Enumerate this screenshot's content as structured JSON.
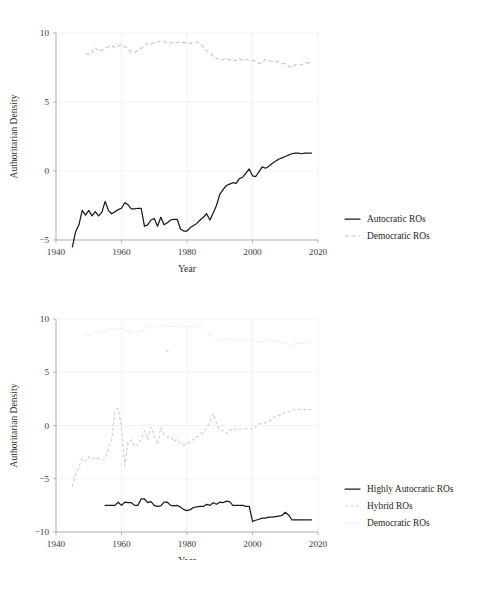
{
  "figure": {
    "axis_label_y": "Authoritarian Density",
    "axis_label_x": "Year",
    "caption_fragment": ""
  },
  "chart_data": [
    {
      "id": "top",
      "type": "line",
      "title": "",
      "xlabel": "Year",
      "ylabel": "Authoritarian Density",
      "xlim": [
        1940,
        2020
      ],
      "ylim": [
        -5,
        10
      ],
      "xticks": [
        1940,
        1960,
        1980,
        2000,
        2020
      ],
      "yticks": [
        -5,
        0,
        5,
        10
      ],
      "grid": true,
      "legend_position": "right",
      "series": [
        {
          "name": "Autocratic ROs",
          "style": "solid",
          "color": "#1a1a1a",
          "x": [
            1945,
            1946,
            1947,
            1948,
            1949,
            1950,
            1951,
            1952,
            1953,
            1954,
            1955,
            1956,
            1957,
            1958,
            1959,
            1960,
            1961,
            1962,
            1963,
            1964,
            1965,
            1966,
            1967,
            1968,
            1969,
            1970,
            1971,
            1972,
            1973,
            1974,
            1975,
            1976,
            1977,
            1978,
            1979,
            1980,
            1981,
            1982,
            1983,
            1984,
            1985,
            1986,
            1987,
            1988,
            1989,
            1990,
            1991,
            1992,
            1993,
            1994,
            1995,
            1996,
            1997,
            1998,
            1999,
            2000,
            2001,
            2002,
            2003,
            2004,
            2005,
            2006,
            2007,
            2008,
            2009,
            2010,
            2011,
            2012,
            2013,
            2014,
            2015,
            2016,
            2017,
            2018
          ],
          "values": [
            -5.5,
            -4.4,
            -3.9,
            -2.85,
            -3.2,
            -2.85,
            -3.25,
            -2.95,
            -3.25,
            -3.0,
            -2.2,
            -2.85,
            -3.1,
            -2.95,
            -2.8,
            -2.7,
            -2.3,
            -2.45,
            -2.75,
            -2.75,
            -2.7,
            -2.7,
            -4.0,
            -3.9,
            -3.55,
            -3.45,
            -4.0,
            -3.35,
            -3.9,
            -3.75,
            -3.55,
            -3.5,
            -3.5,
            -4.2,
            -4.35,
            -4.35,
            -4.1,
            -3.95,
            -3.8,
            -3.55,
            -3.35,
            -3.1,
            -3.55,
            -3.05,
            -2.5,
            -1.7,
            -1.35,
            -1.05,
            -0.95,
            -0.85,
            -0.9,
            -0.55,
            -0.45,
            -0.15,
            0.15,
            -0.35,
            -0.4,
            -0.05,
            0.3,
            0.2,
            0.35,
            0.55,
            0.7,
            0.85,
            0.95,
            1.05,
            1.15,
            1.25,
            1.3,
            1.3,
            1.25,
            1.3,
            1.3,
            1.3
          ]
        },
        {
          "name": "Democratic ROs",
          "style": "dashed",
          "color": "#c6c6c6",
          "x": [
            1949,
            1950,
            1951,
            1952,
            1953,
            1954,
            1955,
            1956,
            1957,
            1958,
            1959,
            1960,
            1961,
            1962,
            1963,
            1964,
            1965,
            1966,
            1967,
            1968,
            1969,
            1970,
            1971,
            1972,
            1973,
            1974,
            1975,
            1976,
            1977,
            1978,
            1979,
            1980,
            1981,
            1982,
            1983,
            1984,
            1985,
            1986,
            1987,
            1988,
            1989,
            1990,
            1991,
            1992,
            1993,
            1994,
            1995,
            1996,
            1997,
            1998,
            1999,
            2000,
            2001,
            2002,
            2003,
            2004,
            2005,
            2006,
            2007,
            2008,
            2009,
            2010,
            2011,
            2012,
            2013,
            2014,
            2015,
            2016,
            2017,
            2018
          ],
          "values": [
            8.5,
            8.45,
            8.6,
            8.95,
            8.65,
            8.75,
            8.9,
            9.0,
            9.1,
            8.95,
            9.05,
            9.15,
            9.0,
            8.85,
            8.6,
            8.6,
            8.75,
            8.9,
            9.05,
            9.3,
            9.2,
            9.3,
            9.35,
            9.45,
            9.4,
            9.25,
            9.3,
            9.3,
            9.3,
            9.35,
            9.3,
            9.3,
            9.25,
            9.3,
            9.35,
            9.2,
            9.0,
            8.7,
            8.6,
            8.3,
            8.15,
            8.1,
            8.05,
            8.2,
            8.05,
            8.05,
            8.0,
            8.15,
            8.0,
            8.1,
            8.0,
            8.0,
            7.95,
            7.8,
            7.85,
            8.1,
            8.0,
            7.95,
            7.95,
            7.9,
            7.8,
            7.75,
            7.6,
            7.5,
            7.7,
            7.7,
            7.7,
            7.8,
            7.85,
            7.8
          ]
        }
      ]
    },
    {
      "id": "bottom",
      "type": "line",
      "title": "",
      "xlabel": "Year",
      "ylabel": "Authoritarian Density",
      "xlim": [
        1940,
        2020
      ],
      "ylim": [
        -10,
        10
      ],
      "xticks": [
        1940,
        1960,
        1980,
        2000,
        2020
      ],
      "yticks": [
        -10,
        -5,
        0,
        5,
        10
      ],
      "grid": true,
      "legend_position": "right",
      "series": [
        {
          "name": "Highly Autocratic ROs",
          "style": "solid",
          "color": "#1a1a1a",
          "x": [
            1955,
            1956,
            1957,
            1958,
            1959,
            1960,
            1961,
            1962,
            1963,
            1964,
            1965,
            1966,
            1967,
            1968,
            1969,
            1970,
            1971,
            1972,
            1973,
            1974,
            1975,
            1976,
            1977,
            1978,
            1979,
            1980,
            1981,
            1982,
            1983,
            1984,
            1985,
            1986,
            1987,
            1988,
            1989,
            1990,
            1991,
            1992,
            1993,
            1994,
            1995,
            1996,
            1997,
            1998,
            1999,
            2000,
            2001,
            2002,
            2003,
            2004,
            2005,
            2006,
            2007,
            2008,
            2009,
            2010,
            2011,
            2012,
            2013,
            2014,
            2015,
            2016,
            2017,
            2018
          ],
          "values": [
            -7.5,
            -7.5,
            -7.5,
            -7.5,
            -7.2,
            -7.5,
            -7.2,
            -7.25,
            -7.25,
            -7.5,
            -7.5,
            -6.9,
            -6.9,
            -7.25,
            -7.15,
            -7.5,
            -7.6,
            -7.55,
            -7.2,
            -7.2,
            -7.5,
            -7.55,
            -7.5,
            -7.65,
            -7.9,
            -8.0,
            -7.9,
            -7.7,
            -7.65,
            -7.6,
            -7.6,
            -7.4,
            -7.5,
            -7.25,
            -7.4,
            -7.2,
            -7.25,
            -7.1,
            -7.15,
            -7.5,
            -7.5,
            -7.5,
            -7.5,
            -7.6,
            -7.6,
            -9.0,
            -8.9,
            -8.8,
            -8.7,
            -8.7,
            -8.6,
            -8.6,
            -8.55,
            -8.5,
            -8.45,
            -8.15,
            -8.4,
            -8.85,
            -8.85,
            -8.85,
            -8.85,
            -8.85,
            -8.85,
            -8.85
          ]
        },
        {
          "name": "Hybrid ROs",
          "style": "dashed",
          "color": "#cfcfcf",
          "x": [
            1945,
            1946,
            1947,
            1948,
            1949,
            1950,
            1951,
            1952,
            1953,
            1954,
            1955,
            1956,
            1957,
            1958,
            1959,
            1960,
            1961,
            1962,
            1963,
            1964,
            1965,
            1966,
            1967,
            1968,
            1969,
            1970,
            1971,
            1972,
            1973,
            1974,
            1975,
            1976,
            1977,
            1978,
            1979,
            1980,
            1981,
            1982,
            1983,
            1984,
            1985,
            1986,
            1987,
            1988,
            1989,
            1990,
            1991,
            1992,
            1993,
            1994,
            1995,
            1996,
            1997,
            1998,
            1999,
            2000,
            2001,
            2002,
            2003,
            2004,
            2005,
            2006,
            2007,
            2008,
            2009,
            2010,
            2011,
            2012,
            2013,
            2014,
            2015,
            2016,
            2017,
            2018
          ],
          "values": [
            -5.75,
            -4.6,
            -3.9,
            -3.1,
            -3.3,
            -2.95,
            -3.2,
            -3.0,
            -3.1,
            -3.2,
            -3.15,
            -2.15,
            -1.3,
            1.3,
            1.6,
            -0.2,
            -3.8,
            -1.55,
            -1.35,
            -2.0,
            -1.75,
            -1.3,
            -0.5,
            -1.3,
            -0.15,
            -1.0,
            -1.8,
            -0.2,
            -0.8,
            -1.1,
            -1.05,
            -1.5,
            -1.3,
            -1.7,
            -1.8,
            -1.75,
            -1.5,
            -1.3,
            -1.1,
            -0.85,
            -0.6,
            -0.3,
            0.4,
            1.1,
            0.2,
            -0.45,
            -0.5,
            -0.75,
            -0.4,
            -0.45,
            -0.3,
            -0.35,
            -0.3,
            -0.3,
            -0.25,
            -0.35,
            -0.1,
            0.15,
            0.15,
            0.25,
            0.4,
            0.65,
            0.85,
            0.95,
            1.05,
            1.3,
            1.25,
            1.45,
            1.5,
            1.5,
            1.5,
            1.5,
            1.5,
            1.5
          ]
        },
        {
          "name": "Democratic ROs",
          "style": "dotted",
          "color": "#e2e2e2",
          "x": [
            1949,
            1950,
            1951,
            1952,
            1953,
            1954,
            1955,
            1956,
            1957,
            1958,
            1959,
            1960,
            1961,
            1962,
            1963,
            1964,
            1965,
            1966,
            1967,
            1968,
            1969,
            1970,
            1971,
            1972,
            1973,
            1974,
            1975,
            1976,
            1977,
            1978,
            1979,
            1980,
            1981,
            1982,
            1983,
            1984,
            1985,
            1986,
            1987,
            1988,
            1989,
            1990,
            1991,
            1992,
            1993,
            1994,
            1995,
            1996,
            1997,
            1998,
            1999,
            2000,
            2001,
            2002,
            2003,
            2004,
            2005,
            2006,
            2007,
            2008,
            2009,
            2010,
            2011,
            2012,
            2013,
            2014,
            2015,
            2016,
            2017,
            2018
          ],
          "values": [
            8.5,
            8.45,
            8.6,
            8.95,
            8.65,
            8.75,
            8.9,
            9.0,
            9.1,
            8.95,
            9.05,
            9.15,
            9.0,
            8.85,
            8.6,
            8.6,
            8.75,
            8.9,
            9.05,
            9.3,
            9.2,
            9.3,
            9.35,
            9.45,
            9.4,
            9.25,
            9.3,
            9.3,
            9.3,
            9.35,
            9.3,
            9.3,
            9.25,
            9.3,
            9.35,
            9.2,
            9.0,
            8.7,
            8.6,
            8.3,
            8.15,
            8.1,
            8.05,
            8.2,
            8.05,
            8.05,
            8.0,
            8.15,
            8.0,
            8.1,
            8.0,
            8.0,
            7.95,
            7.8,
            7.85,
            8.1,
            8.0,
            7.95,
            7.95,
            7.9,
            7.8,
            7.75,
            7.6,
            7.5,
            7.7,
            7.7,
            7.7,
            7.8,
            7.85,
            7.8
          ]
        }
      ],
      "annotations": [
        {
          "name": "stray-marker",
          "x": 1974,
          "y": 7.0
        }
      ]
    }
  ]
}
